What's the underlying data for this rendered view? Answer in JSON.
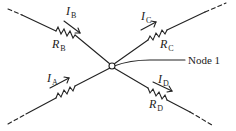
{
  "diagram": {
    "type": "circuit-node",
    "node": {
      "label": "Node 1"
    },
    "branches": [
      {
        "id": "A",
        "current": {
          "symbol": "I",
          "sub": "A"
        },
        "resistor": {
          "symbol": "R",
          "sub": "A",
          "label_visible": false
        },
        "direction": "toward-node",
        "position": "lower-left"
      },
      {
        "id": "B",
        "current": {
          "symbol": "I",
          "sub": "B"
        },
        "resistor": {
          "symbol": "R",
          "sub": "B",
          "label_visible": true
        },
        "direction": "toward-node",
        "position": "upper-left"
      },
      {
        "id": "C",
        "current": {
          "symbol": "I",
          "sub": "C"
        },
        "resistor": {
          "symbol": "R",
          "sub": "C",
          "label_visible": true
        },
        "direction": "away-from-node",
        "position": "upper-right"
      },
      {
        "id": "D",
        "current": {
          "symbol": "I",
          "sub": "D"
        },
        "resistor": {
          "symbol": "R",
          "sub": "D",
          "label_visible": true
        },
        "direction": "away-from-node",
        "position": "lower-right"
      }
    ],
    "colors": {
      "line": "#222222",
      "background": "#ffffff"
    }
  }
}
